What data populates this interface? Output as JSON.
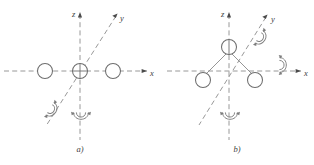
{
  "figure": {
    "background_color": "#ffffff",
    "line_color": "#8c8c8c",
    "atom_stroke_color": "#6e6e6e",
    "label_color": "#3d3d3d"
  },
  "panels": [
    {
      "id": "panel-a",
      "caption": "a)",
      "caption_x": 80,
      "caption_y": 152,
      "geometry": "linear",
      "axes": [
        {
          "name": "x",
          "label": "x",
          "label_x": 150,
          "label_y": 76,
          "x1": 4,
          "y1": 71,
          "x2": 147,
          "y2": 71
        },
        {
          "name": "z",
          "label": "z",
          "label_x": 73,
          "label_y": 16,
          "x1": 80,
          "y1": 14,
          "x2": 80,
          "y2": 140
        },
        {
          "name": "y",
          "label": "y",
          "label_x": 121,
          "label_y": 21,
          "x1": 116,
          "y1": 16,
          "x2": 46,
          "y2": 126
        }
      ],
      "atoms": [
        {
          "name": "atom-left",
          "cx": 45,
          "cy": 71,
          "r": 7.5,
          "center": false
        },
        {
          "name": "atom-center",
          "cx": 80,
          "cy": 71,
          "r": 7.5,
          "center": true
        },
        {
          "name": "atom-right",
          "cx": 113,
          "cy": 71,
          "r": 7.5,
          "center": false
        }
      ],
      "bonds": [],
      "rotations": [
        {
          "name": "rotation-axis-y",
          "cx": 52,
          "cy": 110,
          "angle": -58
        },
        {
          "name": "rotation-axis-z",
          "cx": 81,
          "cy": 115,
          "angle": 0
        }
      ]
    },
    {
      "id": "panel-b",
      "caption": "b)",
      "caption_x": 237,
      "caption_y": 152,
      "geometry": "bent",
      "axes": [
        {
          "name": "x",
          "label": "x",
          "label_x": 304,
          "label_y": 76,
          "x1": 167,
          "y1": 71,
          "x2": 301,
          "y2": 71
        },
        {
          "name": "z",
          "label": "z",
          "label_x": 222,
          "label_y": 16,
          "x1": 229,
          "y1": 14,
          "x2": 229,
          "y2": 140
        },
        {
          "name": "y",
          "label": "y",
          "label_x": 272,
          "label_y": 22,
          "x1": 266,
          "y1": 17,
          "x2": 199,
          "y2": 125
        }
      ],
      "atoms": [
        {
          "name": "atom-apex",
          "cx": 229,
          "cy": 47,
          "r": 7.5,
          "center": true
        },
        {
          "name": "atom-lower-left",
          "cx": 203,
          "cy": 80,
          "r": 7.5,
          "center": false
        },
        {
          "name": "atom-lower-right",
          "cx": 255,
          "cy": 80,
          "r": 7.5,
          "center": false
        }
      ],
      "bonds": [
        {
          "name": "bond-apex-left",
          "x1": 229,
          "y1": 47,
          "x2": 203,
          "y2": 80
        },
        {
          "name": "bond-apex-right",
          "x1": 229,
          "y1": 47,
          "x2": 255,
          "y2": 80
        }
      ],
      "rotations": [
        {
          "name": "rotation-axis-y",
          "cx": 261,
          "cy": 38,
          "angle": -58
        },
        {
          "name": "rotation-axis-x",
          "cx": 282,
          "cy": 66,
          "angle": -90
        },
        {
          "name": "rotation-axis-z",
          "cx": 230,
          "cy": 115,
          "angle": 0
        }
      ]
    }
  ]
}
